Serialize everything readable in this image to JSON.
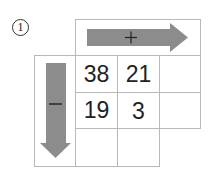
{
  "problem": {
    "label": "1",
    "add_operator": "+",
    "subtract_operator": "−",
    "colors": {
      "arrow": "#8c8c8c",
      "grid": "#b8b8b8",
      "text": "#222222"
    }
  },
  "grid": {
    "rows": [
      [
        "38",
        "21",
        ""
      ],
      [
        "19",
        "3",
        ""
      ],
      [
        "",
        ""
      ]
    ]
  }
}
